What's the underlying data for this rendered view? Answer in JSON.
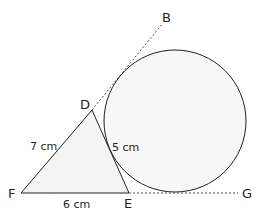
{
  "diagram": {
    "points": {
      "B": "B",
      "D": "D",
      "E": "E",
      "F": "F",
      "G": "G"
    },
    "measurements": {
      "DF": "7 cm",
      "DE": "5 cm",
      "FE": "6 cm"
    },
    "colors": {
      "stroke": "#231f20",
      "triangle_fill": "#f4f4f4",
      "circle_fill": "#f7f7f7"
    }
  }
}
